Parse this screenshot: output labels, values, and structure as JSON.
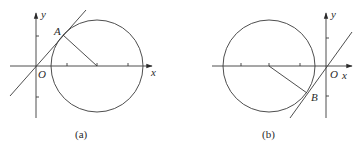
{
  "figures": [
    {
      "id": "a",
      "caption": "(a)",
      "axis_labels": {
        "x": "x",
        "y": "y",
        "origin": "O"
      },
      "point_label": "A",
      "description": "Circle centered on positive x-axis with tangent line through origin touching circle at point A in first quadrant; radius drawn from A to center"
    },
    {
      "id": "b",
      "caption": "(b)",
      "axis_labels": {
        "x": "x",
        "y": "y",
        "origin": "O"
      },
      "point_label": "B",
      "description": "Circle centered on negative x-axis with tangent line through origin touching circle at point B in third quadrant; radius drawn from center to B"
    }
  ],
  "colors": {
    "stroke": "#3a3a3a",
    "text": "#2a2a2a",
    "background": "#ffffff"
  }
}
